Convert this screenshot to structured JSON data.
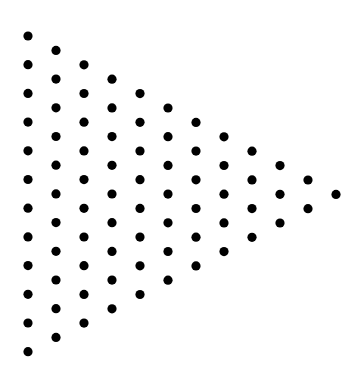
{
  "figure": {
    "background": "#ffffff",
    "dot_color": "#000000",
    "dot_radius": 4.6,
    "columns": 12,
    "dots_per_column": [
      12,
      11,
      10,
      9,
      8,
      7,
      6,
      5,
      4,
      3,
      2,
      1
    ],
    "total_dots": 78,
    "origin": {
      "x": 28,
      "y": 36
    },
    "column_spacing": 28,
    "row_spacing": 28.7,
    "column_vertical_offset": 14.4
  }
}
